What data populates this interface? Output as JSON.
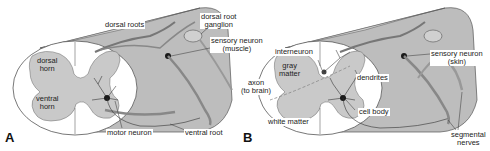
{
  "figure": {
    "panels": [
      {
        "letter": "A",
        "labels": {
          "dorsal_roots": "dorsal roots",
          "dorsal_root_ganglion_1": "dorsal root",
          "dorsal_root_ganglion_2": "ganglion",
          "sensory_neuron_1": "sensory neuron",
          "sensory_neuron_2": "(muscle)",
          "dorsal_horn_1": "dorsal",
          "dorsal_horn_2": "horn",
          "ventral_horn_1": "ventral",
          "ventral_horn_2": "horn",
          "motor_neuron": "motor neuron",
          "ventral_root": "ventral root"
        }
      },
      {
        "letter": "B",
        "labels": {
          "interneuron": "interneuron",
          "gray_matter_1": "gray",
          "gray_matter_2": "matter",
          "axon_1": "axon",
          "axon_2": "(to brain)",
          "dendrites": "dendrites",
          "cell_body": "cell body",
          "white_matter": "white matter",
          "sensory_neuron_1": "sensory neuron",
          "sensory_neuron_2": "(skin)",
          "segmental_nerves_1": "segmental",
          "segmental_nerves_2": "nerves"
        }
      }
    ],
    "colors": {
      "gray_matter": "#c9c9c9",
      "cord_side": "#bdbdbd",
      "cord_top": "#d6d6d6",
      "outline": "#555555",
      "neuron": "#1a1a1a",
      "white_matter": "#ffffff"
    }
  }
}
